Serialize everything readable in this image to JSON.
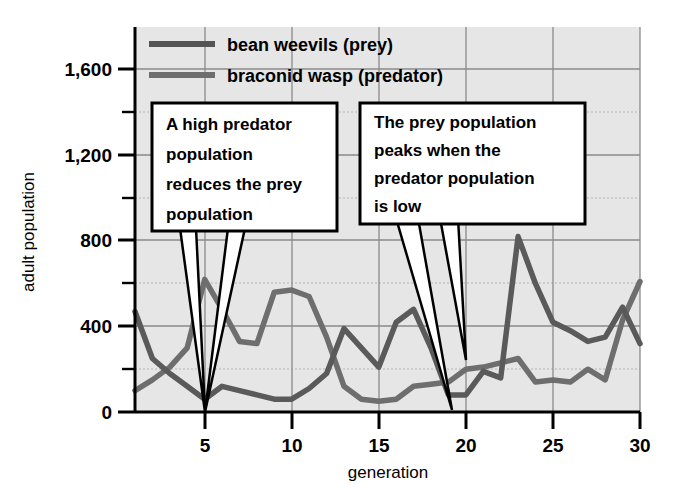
{
  "chart_data": {
    "type": "line",
    "title": "",
    "xlabel": "generation",
    "ylabel": "adult population",
    "xlim": [
      1,
      30
    ],
    "ylim": [
      0,
      1800
    ],
    "xticks": [
      5,
      10,
      15,
      20,
      25,
      30
    ],
    "xtick_labels": [
      "5",
      "10",
      "15",
      "20",
      "25",
      "30"
    ],
    "yticks": [
      0,
      400,
      800,
      1200,
      1600
    ],
    "ytick_labels": [
      "0",
      "400",
      "800",
      "1,200",
      "1,600"
    ],
    "yminor_ticks": [
      200,
      600,
      1000,
      1400
    ],
    "grid": true,
    "legend_position": "top-left-inside",
    "x": [
      1,
      2,
      3,
      4,
      5,
      6,
      7,
      8,
      9,
      10,
      11,
      12,
      13,
      14,
      15,
      16,
      17,
      18,
      19,
      20,
      21,
      22,
      23,
      24,
      25,
      26,
      27,
      28,
      29,
      30
    ],
    "series": [
      {
        "name": "bean weevils (prey)",
        "role": "prey",
        "color": "#5a5a5a",
        "values": [
          470,
          250,
          180,
          120,
          60,
          120,
          100,
          80,
          60,
          60,
          110,
          180,
          390,
          300,
          210,
          420,
          480,
          300,
          80,
          80,
          190,
          160,
          820,
          600,
          420,
          380,
          330,
          350,
          490,
          320
        ]
      },
      {
        "name": "braconid wasp (predator)",
        "role": "predator",
        "color": "#6e6e6e",
        "values": [
          100,
          150,
          210,
          300,
          620,
          480,
          330,
          320,
          560,
          570,
          540,
          350,
          120,
          60,
          50,
          60,
          120,
          130,
          140,
          200,
          210,
          230,
          250,
          140,
          150,
          140,
          200,
          150,
          430,
          610
        ]
      }
    ],
    "annotations": [
      {
        "id": "annotation-predator-reduces-prey",
        "lines": [
          "A high predator",
          "population",
          "reduces the prey",
          "population"
        ],
        "points_to": [
          {
            "x": 5,
            "y": 620,
            "label": "predator-peak-gen5"
          },
          {
            "x": 5,
            "y": 60,
            "label": "prey-trough-gen5"
          }
        ]
      },
      {
        "id": "annotation-prey-peaks-when-predator-low",
        "lines": [
          "The prey population",
          "peaks when the",
          "predator population",
          "is low"
        ],
        "points_to": [
          {
            "x": 19,
            "y": 80,
            "label": "prey-trough-gen19"
          },
          {
            "x": 19.6,
            "y": 200,
            "label": "predator-low-gen20"
          }
        ]
      }
    ]
  },
  "colors": {
    "plot_background": "#e6e6e6",
    "grid_major": "#8c8c8c",
    "grid_minor": "#b0b0b0",
    "axis": "#000000",
    "callout_fill": "#ffffff",
    "callout_border": "#000000"
  }
}
